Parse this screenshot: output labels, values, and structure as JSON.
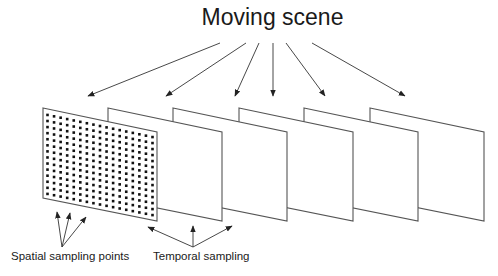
{
  "diagram": {
    "title": "Moving scene",
    "labels": {
      "spatial": "Spatial sampling points",
      "temporal": "Temporal sampling"
    },
    "frames": {
      "count": 6,
      "left_x": [
        43,
        108,
        173,
        239,
        304,
        370
      ],
      "width": 114,
      "top_left_y": 108,
      "top_right_y": 132,
      "bottom_left_y": 198,
      "bottom_right_y": 221
    },
    "dot_grid": {
      "frame_index": 0,
      "columns": 17,
      "rows": 14
    },
    "scene_arrows": [
      {
        "from": [
          220,
          43
        ],
        "to": [
          88,
          96
        ]
      },
      {
        "from": [
          246,
          43
        ],
        "to": [
          166,
          96
        ]
      },
      {
        "from": [
          259,
          43
        ],
        "to": [
          235,
          96
        ]
      },
      {
        "from": [
          273,
          43
        ],
        "to": [
          273,
          96
        ]
      },
      {
        "from": [
          286,
          43
        ],
        "to": [
          325,
          96
        ]
      },
      {
        "from": [
          312,
          43
        ],
        "to": [
          405,
          96
        ]
      }
    ],
    "spatial_arrows": [
      {
        "from": [
          62,
          247
        ],
        "to": [
          57,
          212
        ]
      },
      {
        "from": [
          62,
          247
        ],
        "to": [
          70,
          213
        ]
      },
      {
        "from": [
          62,
          247
        ],
        "to": [
          86,
          217
        ]
      }
    ],
    "temporal_arrows": [
      {
        "from": [
          193,
          247
        ],
        "to": [
          148,
          227
        ]
      },
      {
        "from": [
          193,
          247
        ],
        "to": [
          193,
          226
        ]
      },
      {
        "from": [
          193,
          247
        ],
        "to": [
          232,
          226
        ]
      }
    ],
    "colors": {
      "line": "#555555",
      "arrow": "#333333",
      "dot": "#111111",
      "text": "#1a1a1a"
    }
  }
}
